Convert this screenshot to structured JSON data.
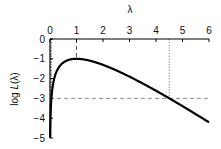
{
  "chart_data": {
    "type": "line",
    "title": "",
    "xlabel": "λ",
    "ylabel": "log L(λ)",
    "xlim": [
      0,
      6
    ],
    "ylim": [
      -5,
      0
    ],
    "x_ticks": [
      0,
      1,
      2,
      3,
      4,
      5,
      6
    ],
    "y_ticks": [
      0,
      -1,
      -2,
      -3,
      -4,
      -5
    ],
    "x_axis_position": "top",
    "grid": false,
    "series": [
      {
        "name": "log L(λ) = log λ − λ",
        "x": [
          0.007,
          0.02,
          0.05,
          0.1,
          0.2,
          0.3,
          0.5,
          0.7,
          1.0,
          1.5,
          2.0,
          2.5,
          3.0,
          3.5,
          4.0,
          4.5,
          5.0,
          5.5,
          6.0
        ],
        "values": [
          -4.97,
          -3.93,
          -3.05,
          -2.4,
          -1.81,
          -1.5,
          -1.19,
          -1.06,
          -1.0,
          -1.09,
          -1.31,
          -1.58,
          -1.9,
          -2.25,
          -2.61,
          -3.0,
          -3.39,
          -3.8,
          -4.21
        ]
      }
    ],
    "annotations": [
      {
        "type": "vline",
        "x": 1,
        "y_from": 0,
        "y_to": -1,
        "style": "dashed",
        "label": "maximum at λ=1"
      },
      {
        "type": "hline",
        "y": -3,
        "style": "dashed",
        "label": "log L = -3 threshold"
      },
      {
        "type": "vline",
        "x": 0.05,
        "y_from": 0,
        "y_to": -3,
        "style": "dotted"
      },
      {
        "type": "vline",
        "x": 4.5,
        "y_from": 0,
        "y_to": -3,
        "style": "dotted"
      }
    ]
  }
}
